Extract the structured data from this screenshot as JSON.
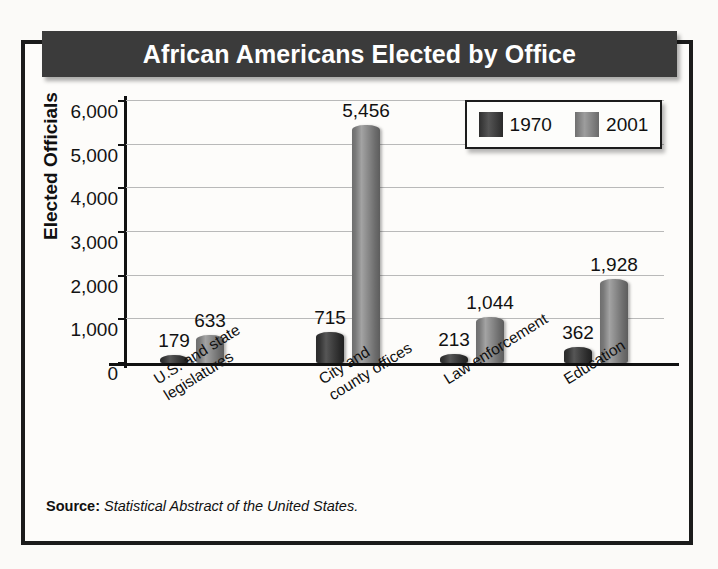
{
  "figure": {
    "title": "African Americans Elected by Office",
    "source_label": "Source:",
    "source_text": "Statistical Abstract of the United States."
  },
  "legend": {
    "entries": [
      {
        "label": "1970",
        "color": "#333333",
        "name": "legend-1970"
      },
      {
        "label": "2001",
        "color": "#808080",
        "name": "legend-2001"
      }
    ]
  },
  "axes": {
    "y_title": "Elected Officials",
    "y_ticks": [
      "0",
      "1,000",
      "2,000",
      "3,000",
      "4,000",
      "5,000",
      "6,000"
    ]
  },
  "chart_data": {
    "type": "bar",
    "title": "African Americans Elected by Office",
    "xlabel": "",
    "ylabel": "Elected Officials",
    "ylim": [
      0,
      6000
    ],
    "ytick_values": [
      0,
      1000,
      2000,
      3000,
      4000,
      5000,
      6000
    ],
    "grid": true,
    "legend_position": "top-right",
    "categories": [
      "U.S. and state legislatures",
      "City and county offices",
      "Law enforcement",
      "Education"
    ],
    "category_lines": [
      [
        "U.S. and state",
        "legislatures"
      ],
      [
        "City and",
        "county offices"
      ],
      [
        "Law enforcement"
      ],
      [
        "Education"
      ]
    ],
    "series": [
      {
        "name": "1970",
        "color": "#333333",
        "values": [
          179,
          715,
          213,
          362
        ]
      },
      {
        "name": "2001",
        "color": "#808080",
        "values": [
          633,
          5456,
          1044,
          1928
        ]
      }
    ],
    "data_labels": [
      [
        "179",
        "633"
      ],
      [
        "715",
        "5,456"
      ],
      [
        "213",
        "1,044"
      ],
      [
        "362",
        "1,928"
      ]
    ],
    "source": "Statistical Abstract of the United States."
  }
}
